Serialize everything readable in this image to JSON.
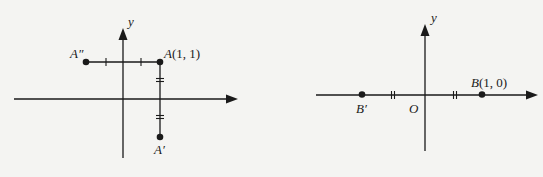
{
  "figures": [
    {
      "id": "reflection-of-A",
      "axis_label_y": "y",
      "points": [
        {
          "name": "A",
          "label": "A(1, 1)",
          "coords": [
            1,
            1
          ]
        },
        {
          "name": "A''",
          "label": "A″"
        },
        {
          "name": "A'",
          "label": "A′"
        }
      ],
      "marks": {
        "horizontal_segment": "single tick marks (equal lengths)",
        "vertical_segment": "double tick marks (equal lengths)"
      }
    },
    {
      "id": "reflection-of-B",
      "axis_label_y": "y",
      "origin_label": "O",
      "points": [
        {
          "name": "B",
          "label": "B(1, 0)",
          "coords": [
            1,
            0
          ]
        },
        {
          "name": "B'",
          "label": "B′"
        }
      ],
      "marks": {
        "x_axis": "double tick marks (equal distances from O)"
      }
    }
  ],
  "labels": {
    "left_y": "y",
    "A": "A(1, 1)",
    "A2": "A″",
    "A1": "A′",
    "right_y": "y",
    "O": "O",
    "B": "B(1, 0)",
    "B1": "B′"
  },
  "colors": {
    "background": "#f4f4f2",
    "ink": "#1a1a1a"
  }
}
